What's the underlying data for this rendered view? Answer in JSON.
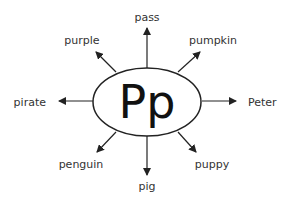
{
  "diagram": {
    "type": "word-web",
    "center": {
      "label": "Pp",
      "cx": 147,
      "cy": 102,
      "rx": 54,
      "ry": 34
    },
    "colors": {
      "stroke": "#222222",
      "text": "#333333",
      "background": "#ffffff"
    },
    "spokes": [
      {
        "word": "pass",
        "x1": 147,
        "y1": 68,
        "x2": 147,
        "y2": 28,
        "tx": 147,
        "ty": 21,
        "anchor": "middle"
      },
      {
        "word": "pumpkin",
        "x1": 178,
        "y1": 72,
        "x2": 200,
        "y2": 52,
        "tx": 213,
        "ty": 44,
        "anchor": "middle"
      },
      {
        "word": "Peter",
        "x1": 202,
        "y1": 101,
        "x2": 236,
        "y2": 101,
        "tx": 248,
        "ty": 106,
        "anchor": "start"
      },
      {
        "word": "puppy",
        "x1": 178,
        "y1": 132,
        "x2": 196,
        "y2": 152,
        "tx": 212,
        "ty": 168,
        "anchor": "middle"
      },
      {
        "word": "pig",
        "x1": 147,
        "y1": 136,
        "x2": 147,
        "y2": 175,
        "tx": 147,
        "ty": 190,
        "anchor": "middle"
      },
      {
        "word": "penguin",
        "x1": 116,
        "y1": 132,
        "x2": 97,
        "y2": 152,
        "tx": 81,
        "ty": 168,
        "anchor": "middle"
      },
      {
        "word": "pirate",
        "x1": 93,
        "y1": 101,
        "x2": 59,
        "y2": 101,
        "tx": 46,
        "ty": 106,
        "anchor": "end"
      },
      {
        "word": "purple",
        "x1": 116,
        "y1": 72,
        "x2": 96,
        "y2": 52,
        "tx": 82,
        "ty": 44,
        "anchor": "middle"
      }
    ]
  }
}
